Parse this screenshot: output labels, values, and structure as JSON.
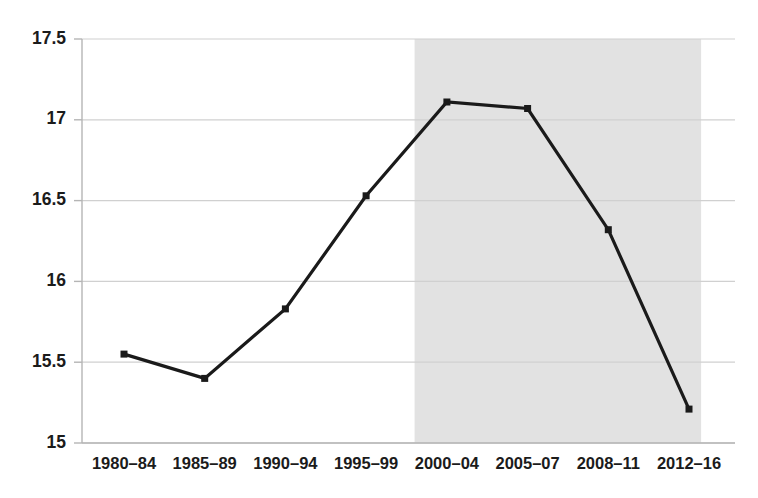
{
  "chart_data": {
    "type": "line",
    "title": "",
    "subtitle": "",
    "xlabel": "",
    "ylabel": "",
    "categories": [
      "1980–84",
      "1985–89",
      "1990–94",
      "1995–99",
      "2000–04",
      "2005–07",
      "2008–11",
      "2012–16"
    ],
    "values": [
      15.55,
      15.4,
      15.83,
      16.53,
      17.11,
      17.07,
      16.32,
      15.21
    ],
    "series": [
      {
        "name": "series-1",
        "values": [
          15.55,
          15.4,
          15.83,
          16.53,
          17.11,
          17.07,
          16.32,
          15.21
        ]
      }
    ],
    "ylim": [
      15,
      17.5
    ],
    "yticks": [
      17.5,
      17,
      16.5,
      16,
      15.5,
      15
    ],
    "ytick_labels": [
      "17.5",
      "17",
      "16.5",
      "16",
      "15.5",
      "15"
    ],
    "xtick_labels": [
      "1980–84",
      "1985–89",
      "1990–94",
      "1995–99",
      "2000–04",
      "2005–07",
      "2008–11",
      "2012–16"
    ],
    "grid": true,
    "grid_axis": "y",
    "legend": false,
    "legend_position": "none",
    "annotations": [],
    "shaded_region": {
      "label": "",
      "start_index": 3.6,
      "end_index": 7.15,
      "color": "#e2e2e2"
    },
    "marker": "square",
    "line_color": "#1a1a1a",
    "marker_color": "#1a1a1a",
    "grid_color": "#d0d0d0",
    "axis_color": "#b5b5b5",
    "background_color": "#ffffff"
  }
}
